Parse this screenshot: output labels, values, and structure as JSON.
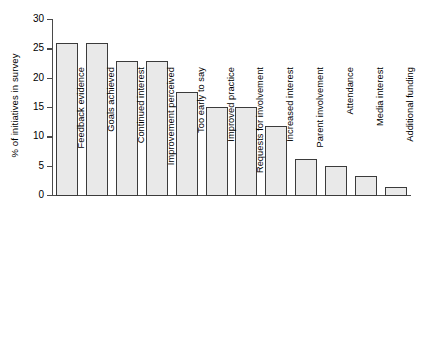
{
  "chart_data": {
    "type": "bar",
    "title": "",
    "xlabel": "",
    "ylabel": "% of initiatives in survey",
    "ylim": [
      0,
      30
    ],
    "ytick_values": [
      0,
      5,
      10,
      15,
      20,
      25,
      30
    ],
    "ytick_labels": [
      "0",
      "5",
      "10",
      "15",
      "20",
      "25",
      "30"
    ],
    "grid": false,
    "legend": null,
    "categories": [
      "Feedback evidence",
      "Goals achieved",
      "Continued interest",
      "Improvement perceived",
      "Too early to say",
      "Improved practice",
      "Requests for involvement",
      "Increased interest",
      "Parent involvement",
      "Attendance",
      "Media interest",
      "Additional funding"
    ],
    "values": [
      26,
      26,
      23,
      23,
      17.8,
      15.2,
      15.2,
      12,
      6.3,
      5.2,
      3.4,
      1.6
    ],
    "bar_fill_color": "#e9e9e9",
    "bar_edge_color": "#3b3b3b",
    "axis_color": "#4a4a4a"
  }
}
